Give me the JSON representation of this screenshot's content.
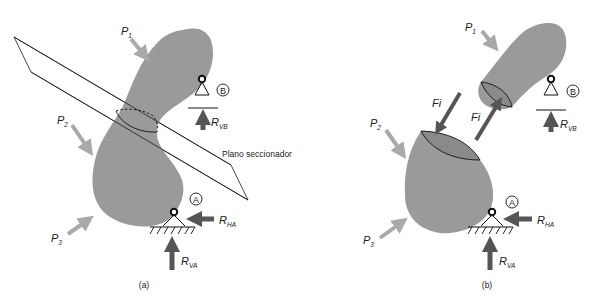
{
  "figure": {
    "colors": {
      "body": "#9a9a9a",
      "load_arrow": "#a9a9a9",
      "reaction_arrow": "#555555",
      "line": "#1a1a1a"
    },
    "panel_a": {
      "caption": "(a)",
      "plane_label": "Plano seccionador",
      "loads": [
        {
          "id": "P1",
          "main": "P",
          "sub": "1"
        },
        {
          "id": "P2",
          "main": "P",
          "sub": "2"
        },
        {
          "id": "P3",
          "main": "P",
          "sub": "3"
        }
      ],
      "supports": {
        "B": {
          "label": "B",
          "reaction": {
            "main": "R",
            "sub": "VB"
          }
        },
        "A": {
          "label": "A",
          "reaction_h": {
            "main": "R",
            "sub": "HA"
          },
          "reaction_v": {
            "main": "R",
            "sub": "VA"
          }
        }
      }
    },
    "panel_b": {
      "caption": "(b)",
      "internal_forces": [
        {
          "id": "Fi_lower",
          "label": "Fi"
        },
        {
          "id": "Fi_upper",
          "label": "Fi"
        }
      ],
      "loads": [
        {
          "id": "P1",
          "main": "P",
          "sub": "1"
        },
        {
          "id": "P2",
          "main": "P",
          "sub": "2"
        },
        {
          "id": "P3",
          "main": "P",
          "sub": "3"
        }
      ],
      "supports": {
        "B": {
          "label": "B",
          "reaction": {
            "main": "R",
            "sub": "VB"
          }
        },
        "A": {
          "label": "A",
          "reaction_h": {
            "main": "R",
            "sub": "HA"
          },
          "reaction_v": {
            "main": "R",
            "sub": "VA"
          }
        }
      }
    }
  }
}
